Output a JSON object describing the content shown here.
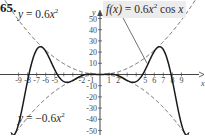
{
  "problem_number": "65.",
  "labels": {
    "upper_envelope": {
      "lhs": "y",
      "eq": " = ",
      "coef": "0.6",
      "var": "x",
      "exp": "2"
    },
    "lower_envelope": {
      "lhs": "y",
      "eq": " = ",
      "coef": "−0.6",
      "var": "x",
      "exp": "2"
    },
    "function": {
      "lhs": "f(x)",
      "eq": " = ",
      "coef": "0.6",
      "var": "x",
      "exp": "2",
      "trig": " cos ",
      "arg": "x"
    }
  },
  "colors": {
    "curve": "#1a1a1a",
    "envelope": "#555555",
    "axis": "#444444",
    "label_bg": "#ececec"
  },
  "chart_data": {
    "type": "line",
    "xlabel": "x",
    "ylabel": "y",
    "xlim": [
      -10.5,
      10.5
    ],
    "ylim": [
      -55,
      60
    ],
    "x_ticks": [
      -9,
      -8,
      -7,
      -6,
      -5,
      -4,
      -3,
      -2,
      -1,
      1,
      2,
      3,
      4,
      5,
      6,
      7,
      8,
      9
    ],
    "x_tick_labels": [
      "-9",
      "-8",
      "-7",
      "-6",
      "-5",
      "",
      "",
      "-2",
      "-1",
      "1",
      "2",
      "",
      "",
      "5",
      "6",
      "7",
      "8",
      "9"
    ],
    "y_ticks": [
      -50,
      -40,
      -30,
      -20,
      -10,
      10,
      20,
      30,
      40,
      50
    ],
    "y_tick_labels": [
      "-50",
      "-40",
      "-30",
      "-20",
      "-10",
      "10",
      "20",
      "30",
      "40",
      "50"
    ],
    "grid": false,
    "series": [
      {
        "name": "f(x) = 0.6x² cos x",
        "style": "solid",
        "formula": "0.6*x^2*cos(x)",
        "domain": [
          -9.7,
          9.7
        ],
        "key_points": [
          [
            -9.42,
            -53.3
          ],
          [
            -7.85,
            0
          ],
          [
            -6.44,
            24.6
          ],
          [
            -4.71,
            0
          ],
          [
            -3.43,
            -6.8
          ],
          [
            -1.57,
            0
          ],
          [
            0,
            0
          ],
          [
            1.57,
            0
          ],
          [
            3.43,
            -6.8
          ],
          [
            4.71,
            0
          ],
          [
            6.44,
            24.6
          ],
          [
            7.85,
            0
          ],
          [
            9.42,
            -53.3
          ]
        ]
      },
      {
        "name": "y = 0.6x²",
        "style": "dashed",
        "formula": "0.6*x^2",
        "domain": [
          -10.5,
          10.5
        ]
      },
      {
        "name": "y = −0.6x²",
        "style": "dashed",
        "formula": "-0.6*x^2",
        "domain": [
          -10.5,
          10.5
        ]
      }
    ],
    "annotations": [
      {
        "text": "y = 0.6x²",
        "position": "upper-left"
      },
      {
        "text": "y = −0.6x²",
        "position": "lower-left"
      },
      {
        "text": "f(x) = 0.6x² cos x",
        "position": "top-right",
        "leader_to": [
          5.2,
          10
        ]
      }
    ]
  }
}
